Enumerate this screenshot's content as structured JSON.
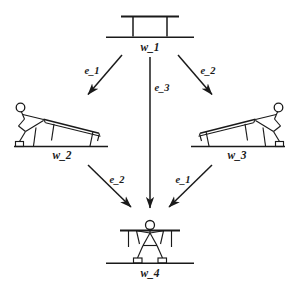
{
  "diagram": {
    "type": "state-transition-diagram",
    "title": "",
    "nodes": [
      {
        "id": "w_1",
        "label": "w_1",
        "position": "top-center",
        "depicts": "table-upright"
      },
      {
        "id": "w_2",
        "label": "w_2",
        "position": "middle-left",
        "depicts": "person-tilting-table-left"
      },
      {
        "id": "w_3",
        "label": "w_3",
        "position": "middle-right",
        "depicts": "person-tilting-table-right"
      },
      {
        "id": "w_4",
        "label": "w_4",
        "position": "bottom-center",
        "depicts": "person-holding-table-overhead"
      }
    ],
    "edges": [
      {
        "id": "edge-w1-w2",
        "label": "e_1",
        "from": "w_1",
        "to": "w_2"
      },
      {
        "id": "edge-w1-w3",
        "label": "e_2",
        "from": "w_1",
        "to": "w_3"
      },
      {
        "id": "edge-w1-w4",
        "label": "e_3",
        "from": "w_1",
        "to": "w_4"
      },
      {
        "id": "edge-w2-w4",
        "label": "e_2",
        "from": "w_2",
        "to": "w_4"
      },
      {
        "id": "edge-w3-w4",
        "label": "e_1",
        "from": "w_3",
        "to": "w_4"
      }
    ],
    "colors": {
      "ink": "#1a1a1a",
      "background": "#ffffff"
    }
  }
}
